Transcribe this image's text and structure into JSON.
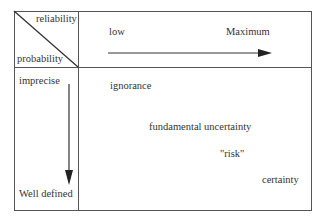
{
  "diagram": {
    "corner": {
      "top_right_label": "reliability",
      "bottom_left_label": "probability"
    },
    "horizontal_axis": {
      "start_label": "low",
      "end_label": "Maximum",
      "direction": "right"
    },
    "vertical_axis": {
      "start_label": "imprecise",
      "end_label": "Well defined",
      "direction": "down"
    },
    "regions": [
      {
        "label": "ignorance"
      },
      {
        "label": "fundamental uncertainty"
      },
      {
        "label": "\"risk\""
      },
      {
        "label": "certainty"
      }
    ],
    "colors": {
      "line": "#555555",
      "text": "#333333",
      "background": "#ffffff"
    }
  }
}
